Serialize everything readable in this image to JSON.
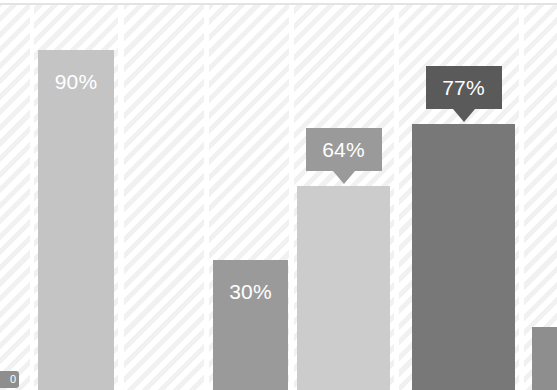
{
  "viewport": {
    "width": 557,
    "height": 390,
    "background": "#ffffff"
  },
  "styling": {
    "hatch_stripe_color": "#f1f1f1",
    "hatch_base_color": "#ffffff",
    "top_rule_color": "#e3e3e3",
    "label_text_color": "#ffffff"
  },
  "corner_badge": {
    "label": "0",
    "background": "#8e8e8e"
  },
  "chart_data": {
    "type": "bar",
    "title": "",
    "subtitle": "",
    "xlabel": "",
    "ylabel": "",
    "ylim": [
      0,
      100
    ],
    "grid": false,
    "legend_position": "none",
    "note": "Zoomed-in crop of a vertical bar chart; bar baselines and category tick labels fall below the visible crop.",
    "categories": [
      "",
      "",
      "",
      "",
      "",
      ""
    ],
    "values": [
      90,
      null,
      30,
      64,
      77,
      null
    ],
    "bars": [
      {
        "name": "bar-90",
        "value": 90,
        "label": "90%",
        "color": "#c4c4c4",
        "label_style": "inline",
        "x": 38,
        "width": 76,
        "top": 50
      },
      {
        "name": "bar-empty-band",
        "value": null,
        "label": "",
        "color": "#ffffff",
        "label_style": "none",
        "x": 124,
        "width": 80,
        "top": 390
      },
      {
        "name": "bar-30",
        "value": 30,
        "label": "30%",
        "color": "#9a9a9a",
        "label_style": "inline",
        "x": 213,
        "width": 75,
        "top": 260
      },
      {
        "name": "bar-64",
        "value": 64,
        "label": "64%",
        "color": "#cccccc",
        "label_style": "callout",
        "callout_color": "#9a9a9a",
        "x": 297,
        "width": 93,
        "top": 186
      },
      {
        "name": "bar-77",
        "value": 77,
        "label": "77%",
        "color": "#787878",
        "label_style": "callout",
        "callout_color": "#5a5a5a",
        "x": 412,
        "width": 103,
        "top": 124
      },
      {
        "name": "bar-partial-right",
        "value": null,
        "label": "",
        "color": "#8e8e8e",
        "label_style": "none",
        "x": 532,
        "width": 25,
        "top": 327
      }
    ],
    "hatch_bands": [
      {
        "x": 0,
        "width": 30
      },
      {
        "x": 34,
        "width": 84
      },
      {
        "x": 124,
        "width": 80
      },
      {
        "x": 209,
        "width": 80
      },
      {
        "x": 294,
        "width": 100
      },
      {
        "x": 399,
        "width": 120
      },
      {
        "x": 524,
        "width": 33
      }
    ]
  }
}
